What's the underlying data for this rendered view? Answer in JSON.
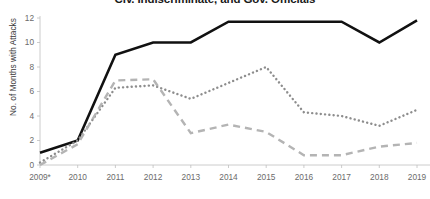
{
  "chart_data": {
    "type": "line",
    "title": "Civ. Indiscriminate, and Gov. Officials",
    "xlabel": "",
    "ylabel": "No. of Months with Attacks",
    "categories": [
      "2009*",
      "2010",
      "2011",
      "2012",
      "2013",
      "2014",
      "2015",
      "2016",
      "2017",
      "2018",
      "2019"
    ],
    "x_tick_labels": [
      "2009*",
      "2010",
      "2011",
      "2012",
      "2013",
      "2014",
      "2015",
      "2016",
      "2017",
      "2018",
      "2019"
    ],
    "y_tick_labels": [
      "0",
      "2",
      "4",
      "6",
      "8",
      "10",
      "12"
    ],
    "y_ticks": [
      0,
      2,
      4,
      6,
      8,
      10,
      12
    ],
    "ylim": [
      0,
      12
    ],
    "grid": false,
    "legend": "none",
    "series": [
      {
        "name": "Gov. Officials",
        "style": "solid",
        "color": "#111111",
        "values": [
          1.0,
          2.0,
          9.0,
          10.0,
          10.0,
          11.7,
          11.7,
          11.7,
          11.7,
          10.0,
          11.8
        ]
      },
      {
        "name": "Civ. Indiscriminate",
        "style": "dotted",
        "color": "#8d8d8d",
        "values": [
          0.2,
          2.0,
          6.3,
          6.5,
          5.4,
          6.7,
          8.0,
          4.3,
          4.0,
          3.2,
          4.5
        ]
      },
      {
        "name": "Civ. Targeted",
        "style": "dashed",
        "color": "#b4b4b4",
        "values": [
          0.0,
          1.7,
          6.9,
          7.0,
          2.6,
          3.3,
          2.7,
          0.8,
          0.8,
          1.5,
          1.8
        ]
      }
    ]
  },
  "axis": {
    "y_title": "No. of Months with Attacks"
  }
}
